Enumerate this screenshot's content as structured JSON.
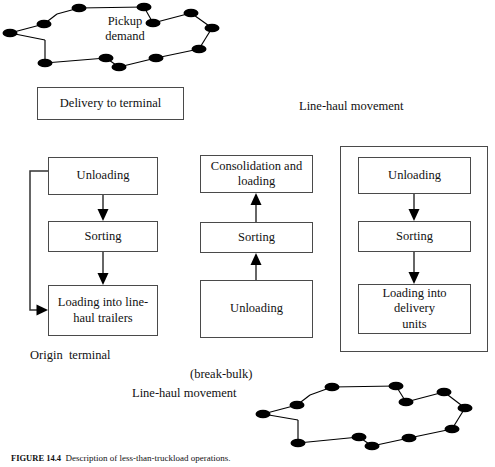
{
  "figure": {
    "caption_label": "FIGURE 14.4",
    "caption_text": "Description of less-than-truckload operations."
  },
  "labels": {
    "pickup_demand": "Pickup\ndemand",
    "line_haul_top": "Line-haul movement",
    "origin_terminal": "Origin  terminal",
    "break_bulk": "(break-bulk)",
    "line_haul_bottom": "Line-haul movement"
  },
  "boxes": {
    "delivery_to_terminal": "Delivery to terminal",
    "origin": {
      "unloading": "Unloading",
      "sorting": "Sorting",
      "loading": "Loading into line-\nhaul trailers"
    },
    "breakbulk": {
      "consolidation": "Consolidation and\nloading",
      "sorting": "Sorting",
      "unloading": "Unloading"
    },
    "destination": {
      "unloading": "Unloading",
      "sorting": "Sorting",
      "loading": "Loading into delivery\nunits"
    }
  },
  "colors": {
    "box_border": "#4a4a4a",
    "node_fill": "#000000",
    "line": "#000000",
    "background": "#ffffff"
  },
  "networks": {
    "pickup_demand_nodes": 13,
    "delivery_demand_nodes": 13
  }
}
